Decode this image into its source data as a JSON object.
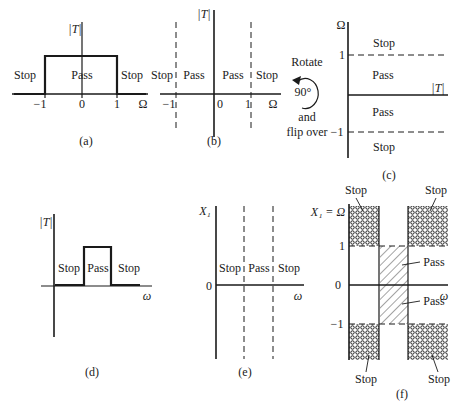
{
  "figure": {
    "panels": [
      {
        "id": "a",
        "caption": "(a)",
        "y_axis_label": "|T|",
        "x_axis_label": "Ω",
        "x_ticks": [
          "−1",
          "0",
          "1"
        ],
        "regions": [
          "Stop",
          "Pass",
          "Stop"
        ],
        "description": "Lowpass magnitude |T| versus Ω with passband −1 to 1"
      },
      {
        "id": "b",
        "caption": "(b)",
        "y_axis_label": "|T|",
        "x_axis_label": "Ω",
        "x_ticks": [
          "−1",
          "0",
          "1"
        ],
        "regions": [
          "Stop",
          "Pass",
          "Pass",
          "Stop"
        ],
        "description": "Band edges shown as dashed lines at Ω = ±1"
      },
      {
        "id": "c",
        "caption": "(c)",
        "y_axis_label": "Ω",
        "x_axis_label": "|T|",
        "y_ticks": [
          "1",
          "−1"
        ],
        "regions": [
          "Stop",
          "Pass",
          "Pass",
          "Stop"
        ],
        "description": "Rotated representation with dashed band edges at Ω = ±1"
      },
      {
        "id": "d",
        "caption": "(d)",
        "y_axis_label": "|T|",
        "x_axis_label": "ω",
        "regions": [
          "Stop",
          "Pass",
          "Stop"
        ],
        "description": "Bandpass magnitude |T| versus ω"
      },
      {
        "id": "e",
        "caption": "(e)",
        "y_axis_label": "X₁",
        "x_axis_label": "ω",
        "y_ticks": [
          "0"
        ],
        "regions": [
          "Stop",
          "Pass",
          "Stop"
        ],
        "description": "Band edges as dashed vertical lines in X₁–ω plane"
      },
      {
        "id": "f",
        "caption": "(f)",
        "y_axis_label": "X₁ = Ω",
        "x_axis_label": "ω",
        "y_ticks": [
          "1",
          "0",
          "−1"
        ],
        "region_labels": {
          "stop_top_left": "Stop",
          "stop_top_right": "Stop",
          "pass_upper": "Pass",
          "pass_lower": "Pass",
          "stop_bottom_left": "Stop",
          "stop_bottom_right": "Stop"
        },
        "description": "Crosshatched stop regions and diagonally hatched pass region in X₁–ω plane"
      }
    ],
    "transform_note": {
      "line1": "Rotate",
      "angle": "90°",
      "line2": "and",
      "line3": "flip over"
    }
  }
}
